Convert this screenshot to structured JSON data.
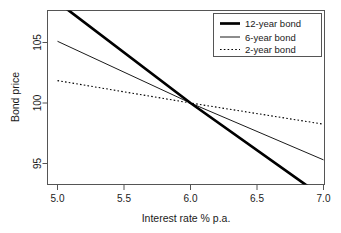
{
  "chart_data": {
    "type": "line",
    "title": "",
    "xlabel": "Interest rate % p.a.",
    "ylabel": "Bond price",
    "xlim": [
      4.925,
      7.0
    ],
    "ylim": [
      92.0,
      108.6
    ],
    "grid": false,
    "legend_position": "top-right",
    "xticks": [
      "5.0",
      "5.5",
      "6.0",
      "6.5",
      "7.0"
    ],
    "xtick_values": [
      5.0,
      5.5,
      6.0,
      6.5,
      7.0
    ],
    "yticks": [
      "95",
      "100",
      "105"
    ],
    "ytick_values": [
      95,
      100,
      105
    ],
    "x": [
      5.0,
      6.0,
      7.0
    ],
    "series": [
      {
        "name": "12-year bond",
        "values": [
          108.35,
          100.0,
          92.2
        ],
        "style": "solid",
        "linewidth": 2.6,
        "color": "#000000"
      },
      {
        "name": "6-year bond",
        "values": [
          105.1,
          100.0,
          95.3
        ],
        "style": "solid",
        "linewidth": 0.9,
        "color": "#000000"
      },
      {
        "name": "2-year bond",
        "values": [
          101.85,
          100.0,
          98.25
        ],
        "style": "dotted",
        "linewidth": 1.0,
        "color": "#000000"
      }
    ]
  },
  "axes": {
    "x_title": "Interest rate % p.a.",
    "y_title": "Bond price",
    "x_tick_labels": [
      "5.0",
      "5.5",
      "6.0",
      "6.5",
      "7.0"
    ],
    "y_tick_labels": [
      "105",
      "100",
      "95"
    ]
  },
  "legend": {
    "entries": [
      {
        "label": "12-year bond",
        "style": "thick-solid"
      },
      {
        "label": "6-year bond",
        "style": "thin-solid"
      },
      {
        "label": "2-year bond",
        "style": "dotted"
      }
    ]
  },
  "colors": {
    "line": "#000000",
    "frame": "#555555",
    "background": "#ffffff",
    "text": "#1a1a1a"
  }
}
